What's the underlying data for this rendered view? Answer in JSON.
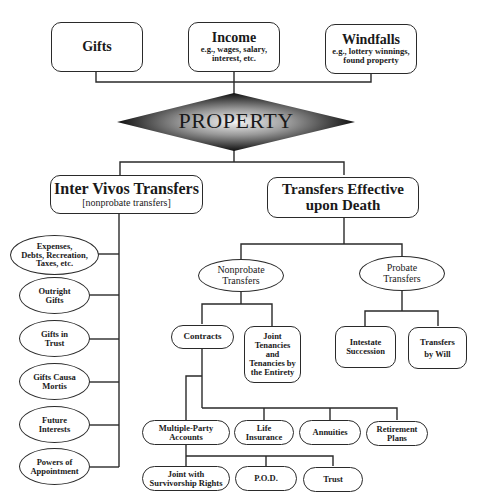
{
  "diagram": {
    "sources": [
      {
        "title": "Gifts",
        "subtitle": ""
      },
      {
        "title": "Income",
        "subtitle_lines": [
          "e.g., wages, salary,",
          "interest, etc."
        ]
      },
      {
        "title": "Windfalls",
        "subtitle_lines": [
          "e.g., lottery winnings,",
          "found property"
        ]
      }
    ],
    "center": {
      "label": "PROPERTY"
    },
    "inter_vivos": {
      "title": "Inter Vivos Transfers",
      "subtitle": "[nonprobate transfers]",
      "children": [
        {
          "lines": [
            "Expenses,",
            "Debts, Recreation,",
            "Taxes, etc."
          ]
        },
        {
          "lines": [
            "Outright",
            "Gifts"
          ]
        },
        {
          "lines": [
            "Gifts in",
            "Trust"
          ]
        },
        {
          "lines": [
            "Gifts Causa",
            "Mortis"
          ]
        },
        {
          "lines": [
            "Future",
            "Interests"
          ]
        },
        {
          "lines": [
            "Powers of",
            "Appointment"
          ]
        }
      ]
    },
    "upon_death": {
      "title_lines": [
        "Transfers Effective",
        "upon Death"
      ],
      "nonprobate": {
        "lines": [
          "Nonprobate",
          "Transfers"
        ],
        "contracts": {
          "label": "Contracts",
          "children": [
            {
              "lines": [
                "Multiple-Party",
                "Accounts"
              ],
              "children": [
                {
                  "lines": [
                    "Joint with",
                    "Survivorship Rights"
                  ]
                },
                {
                  "lines": [
                    "P.O.D."
                  ]
                },
                {
                  "lines": [
                    "Trust"
                  ]
                }
              ]
            },
            {
              "lines": [
                "Life",
                "Insurance"
              ]
            },
            {
              "lines": [
                "Annuities"
              ]
            },
            {
              "lines": [
                "Retirement",
                "Plans"
              ]
            }
          ]
        },
        "joint_tenancies": {
          "lines": [
            "Joint",
            "Tenancies",
            "and",
            "Tenancies by",
            "the Entirety"
          ]
        }
      },
      "probate": {
        "lines": [
          "Probate",
          "Transfers"
        ],
        "children": [
          {
            "lines": [
              "Intestate",
              "Succession"
            ]
          },
          {
            "lines": [
              "Transfers",
              "by Will"
            ]
          }
        ]
      }
    }
  },
  "colors": {
    "line": "#2a2a2a",
    "diamond_center": "#f2f2f2",
    "diamond_edge": "#111111"
  }
}
